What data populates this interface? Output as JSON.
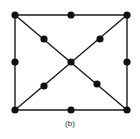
{
  "caption": "(b)",
  "colors": {
    "line": "#1a1a1a",
    "node": "#111111",
    "background": "#ffffff"
  },
  "nodes": [
    {
      "id": "tl",
      "x": 15,
      "y": 15
    },
    {
      "id": "tm",
      "x": 71,
      "y": 15
    },
    {
      "id": "tr",
      "x": 127,
      "y": 15
    },
    {
      "id": "ml",
      "x": 15,
      "y": 62
    },
    {
      "id": "c",
      "x": 71,
      "y": 62
    },
    {
      "id": "mr",
      "x": 127,
      "y": 62
    },
    {
      "id": "bl",
      "x": 15,
      "y": 110
    },
    {
      "id": "bm",
      "x": 71,
      "y": 110
    },
    {
      "id": "br",
      "x": 127,
      "y": 110
    },
    {
      "id": "d1",
      "x": 44,
      "y": 39
    },
    {
      "id": "d2",
      "x": 100,
      "y": 39
    },
    {
      "id": "d3",
      "x": 44,
      "y": 86
    },
    {
      "id": "d4",
      "x": 97,
      "y": 84
    }
  ],
  "edges": [
    [
      "tl",
      "tr"
    ],
    [
      "tr",
      "br"
    ],
    [
      "br",
      "bl"
    ],
    [
      "bl",
      "tl"
    ],
    [
      "tl",
      "br"
    ],
    [
      "tr",
      "bl"
    ]
  ]
}
